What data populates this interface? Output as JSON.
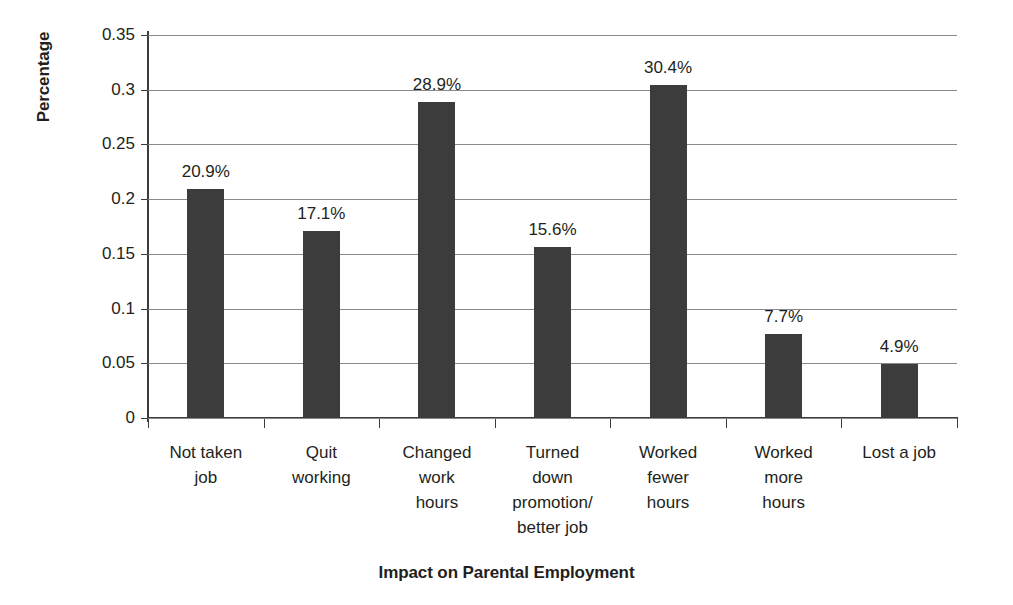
{
  "chart_data": {
    "type": "bar",
    "title": "",
    "xlabel": "Impact on Parental Employment",
    "ylabel": "Percentage",
    "categories": [
      "Not taken\njob",
      "Quit\nworking",
      "Changed\nwork\nhours",
      "Turned\ndown\npromotion/\nbetter job",
      "Worked\nfewer\nhours",
      "Worked\nmore\nhours",
      "Lost a job"
    ],
    "values": [
      0.209,
      0.171,
      0.289,
      0.156,
      0.304,
      0.077,
      0.049
    ],
    "data_labels": [
      "20.9%",
      "17.1%",
      "28.9%",
      "15.6%",
      "30.4%",
      "7.7%",
      "4.9%"
    ],
    "ylim": [
      0,
      0.35
    ],
    "ytick_values": [
      0,
      0.05,
      0.1,
      0.15,
      0.2,
      0.25,
      0.3,
      0.35
    ],
    "ytick_labels": [
      "0",
      "0.05",
      "0.1",
      "0.15",
      "0.2",
      "0.25",
      "0.3",
      "0.35"
    ],
    "grid": true,
    "legend": false,
    "bar_color": "#3c3c3c",
    "gridline_color": "#8a8a8a",
    "axis_color": "#3b3b3b",
    "background_color": "#ffffff"
  }
}
